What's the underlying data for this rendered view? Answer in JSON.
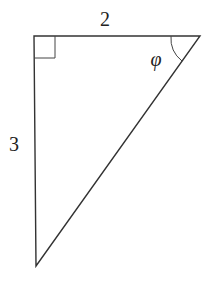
{
  "diagram": {
    "type": "right-triangle",
    "labels": {
      "top_side": "2",
      "left_side": "3",
      "angle": "φ"
    },
    "stroke_color": "#333333",
    "vertices": {
      "right_angle": [
        34,
        36
      ],
      "top_right": [
        200,
        36
      ],
      "bottom": [
        36,
        266
      ]
    }
  }
}
